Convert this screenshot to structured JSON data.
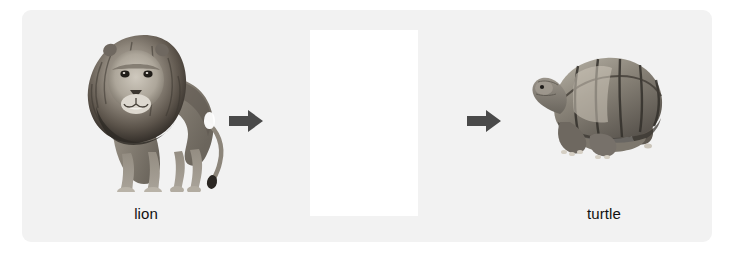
{
  "figure": {
    "type": "analogy-sequence",
    "background_color": "#ffffff",
    "panel_color": "#f2f2f2",
    "arrow_color": "#4a4a4a",
    "blank_color": "#ffffff"
  },
  "items": [
    {
      "id": "lion",
      "label": "lion",
      "image_kind": "photo",
      "subject": "lion standing, facing forward, full body with mane",
      "rendering": "grayscale"
    },
    {
      "id": "blank",
      "label": "",
      "image_kind": "blank",
      "subject": "white masked rectangle (image removed)",
      "rendering": "solid-white"
    },
    {
      "id": "turtle",
      "label": "turtle",
      "image_kind": "photo",
      "subject": "tortoise in profile facing left, domed shell",
      "rendering": "grayscale"
    }
  ],
  "arrows": [
    {
      "id": "arrow-1",
      "direction": "right"
    },
    {
      "id": "arrow-2",
      "direction": "right"
    }
  ]
}
